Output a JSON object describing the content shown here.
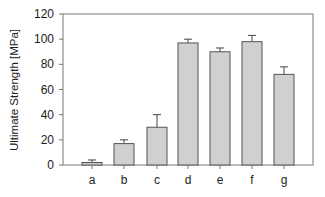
{
  "chart_data": {
    "type": "bar",
    "title": "",
    "xlabel": "",
    "ylabel": "Ultimate Strength [MPa]",
    "ylim": [
      0,
      120
    ],
    "yticks": [
      0,
      20,
      40,
      60,
      80,
      100,
      120
    ],
    "categories": [
      "a",
      "b",
      "c",
      "d",
      "e",
      "f",
      "g"
    ],
    "values": [
      2,
      17,
      30,
      97,
      90,
      98,
      72
    ],
    "error_bars": [
      2,
      3,
      10,
      3,
      3,
      5,
      6
    ],
    "grid": false,
    "legend": null,
    "bar_color": "#d0d0d0",
    "bar_edge_color": "#555555"
  },
  "layout": {
    "plot_left": 63,
    "plot_right": 313,
    "plot_top": 14,
    "plot_bottom": 165,
    "bar_width": 20,
    "bar_centers": [
      92,
      124,
      157,
      188,
      220,
      252,
      284
    ]
  }
}
